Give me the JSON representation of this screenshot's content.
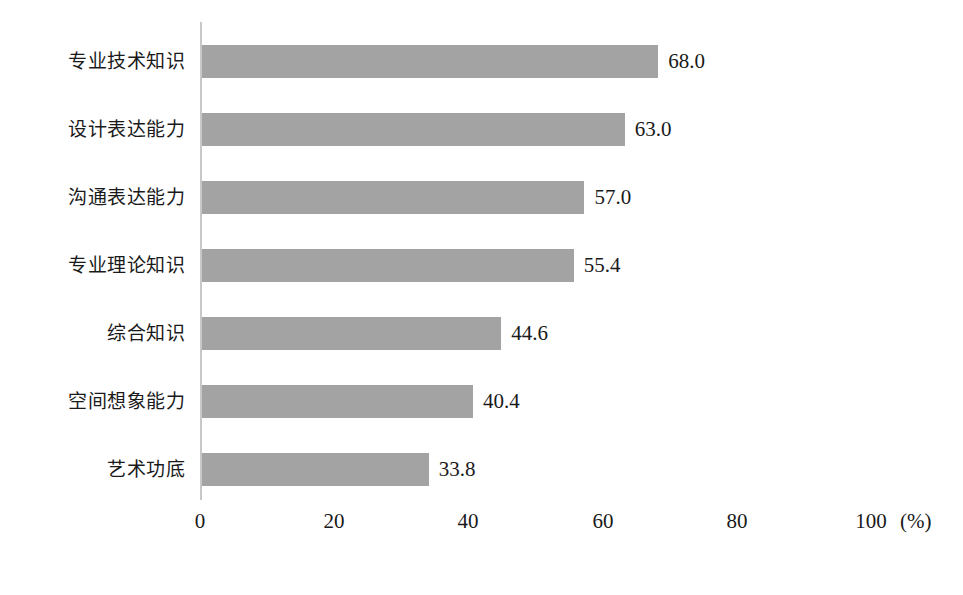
{
  "chart_data": {
    "type": "bar",
    "orientation": "horizontal",
    "title": "",
    "subtitle": "",
    "xlabel": "(%)",
    "ylabel": "",
    "categories": [
      "专业技术知识",
      "设计表达能力",
      "沟通表达能力",
      "专业理论知识",
      "综合知识",
      "空间想象能力",
      "艺术功底"
    ],
    "values": [
      68.0,
      63.0,
      57.0,
      55.4,
      44.6,
      40.4,
      33.8
    ],
    "value_labels": [
      "68.0",
      "63.0",
      "57.0",
      "55.4",
      "44.6",
      "40.4",
      "33.8"
    ],
    "xlim": [
      0,
      100
    ],
    "xticks": [
      0,
      20,
      40,
      60,
      80,
      100
    ],
    "xtick_labels": [
      "0",
      "20",
      "40",
      "60",
      "80",
      "100"
    ],
    "unit_label": "(%)",
    "grid": false,
    "legend": false,
    "bar_color": "#a3a3a3",
    "axis_color": "#c8c8c8",
    "text_color": "#1a1a1a",
    "background_color": "#ffffff"
  }
}
